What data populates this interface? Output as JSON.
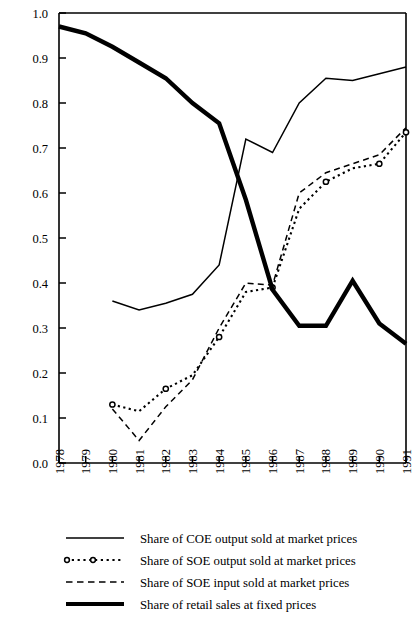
{
  "chart_data": {
    "type": "line",
    "title": "",
    "subtitle": "",
    "xlabel": "",
    "ylabel": "",
    "xlim": [
      1978,
      1991
    ],
    "ylim": [
      0.0,
      1.0
    ],
    "grid": false,
    "legend_position": "bottom",
    "x": [
      1978,
      1979,
      1980,
      1981,
      1982,
      1983,
      1984,
      1985,
      1986,
      1987,
      1988,
      1989,
      1990,
      1991
    ],
    "categories": [
      "1978",
      "1979",
      "1980",
      "1981",
      "1982",
      "1983",
      "1984",
      "1985",
      "1986",
      "1987",
      "1988",
      "1989",
      "1990",
      "1991"
    ],
    "ytick_labels": [
      "0.0",
      "0.1",
      "0.2",
      "0.3",
      "0.4",
      "0.5",
      "0.6",
      "0.7",
      "0.8",
      "0.9",
      "1.0"
    ],
    "ytick_values": [
      0.0,
      0.1,
      0.2,
      0.3,
      0.4,
      0.5,
      0.6,
      0.7,
      0.8,
      0.9,
      1.0
    ],
    "series": [
      {
        "name": "Share of COE output sold at market prices",
        "style": "thin-solid",
        "x": [
          1980,
          1981,
          1982,
          1983,
          1984,
          1985,
          1986,
          1987,
          1988,
          1989,
          1990,
          1991
        ],
        "values": [
          0.36,
          0.34,
          0.355,
          0.375,
          0.44,
          0.72,
          0.69,
          0.8,
          0.855,
          0.85,
          0.865,
          0.88
        ]
      },
      {
        "name": "Share of SOE output sold at market prices",
        "style": "dotted-circle",
        "x": [
          1980,
          1981,
          1982,
          1983,
          1984,
          1985,
          1986,
          1987,
          1988,
          1989,
          1990,
          1991
        ],
        "values": [
          0.13,
          0.115,
          0.165,
          0.195,
          0.28,
          0.38,
          0.39,
          0.565,
          0.625,
          0.655,
          0.665,
          0.735
        ]
      },
      {
        "name": "Share of SOE input sold at market prices",
        "style": "dashed",
        "x": [
          1980,
          1981,
          1982,
          1983,
          1984,
          1985,
          1986,
          1987,
          1988,
          1989,
          1990,
          1991
        ],
        "values": [
          0.12,
          0.05,
          0.125,
          0.185,
          0.3,
          0.4,
          0.395,
          0.6,
          0.645,
          0.665,
          0.685,
          0.745
        ]
      },
      {
        "name": "Share of retail sales at fixed prices",
        "style": "thick-solid",
        "x": [
          1978,
          1979,
          1980,
          1981,
          1982,
          1983,
          1984,
          1985,
          1986,
          1987,
          1988,
          1989,
          1990,
          1991
        ],
        "values": [
          0.97,
          0.955,
          0.925,
          0.89,
          0.855,
          0.8,
          0.755,
          0.585,
          0.385,
          0.305,
          0.305,
          0.405,
          0.31,
          0.265
        ]
      }
    ]
  },
  "legend": {
    "items": [
      {
        "label": "Share of COE output sold at market prices",
        "style": "thin-solid"
      },
      {
        "label": "Share of SOE output sold at market prices",
        "style": "dotted-circle"
      },
      {
        "label": "Share of SOE input sold at market prices",
        "style": "dashed"
      },
      {
        "label": "Share of retail sales at fixed prices",
        "style": "thick-solid"
      }
    ]
  },
  "colors": {
    "ink": "#000000",
    "background": "#ffffff"
  }
}
